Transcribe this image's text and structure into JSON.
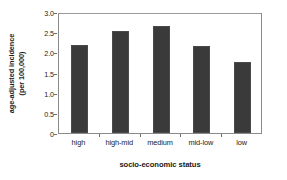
{
  "chart_data": {
    "type": "bar",
    "title": "",
    "subtitle": "",
    "categories": [
      "high",
      "high-mid",
      "medium",
      "mid-low",
      "low"
    ],
    "values": [
      2.17,
      2.54,
      2.65,
      2.15,
      1.76
    ],
    "series": [
      {
        "name": "age-adjusted incidence",
        "values": [
          2.17,
          2.54,
          2.65,
          2.15,
          1.76
        ]
      }
    ],
    "xlabel": "socio-economic status",
    "ylabel": "age-adjusted incidence (per 100,000)",
    "ylabel_line1": "age-adjusted incidence",
    "ylabel_line2": "(per 100,000)",
    "ylim": [
      0,
      3.0
    ],
    "ytick_values": [
      3.0,
      2.5,
      2.0,
      1.5,
      1.0,
      0.5,
      0
    ],
    "ytick_labels": [
      "3.0",
      "2.5",
      "2.0",
      "1.5",
      "1.0",
      "0.5",
      "0"
    ],
    "grid": false,
    "legend": false,
    "legend_position": "none",
    "bar_color": "#3a3a3a",
    "frame_color": "#8a8a8a",
    "background_color": "#ffffff",
    "text_color": "#222222"
  }
}
